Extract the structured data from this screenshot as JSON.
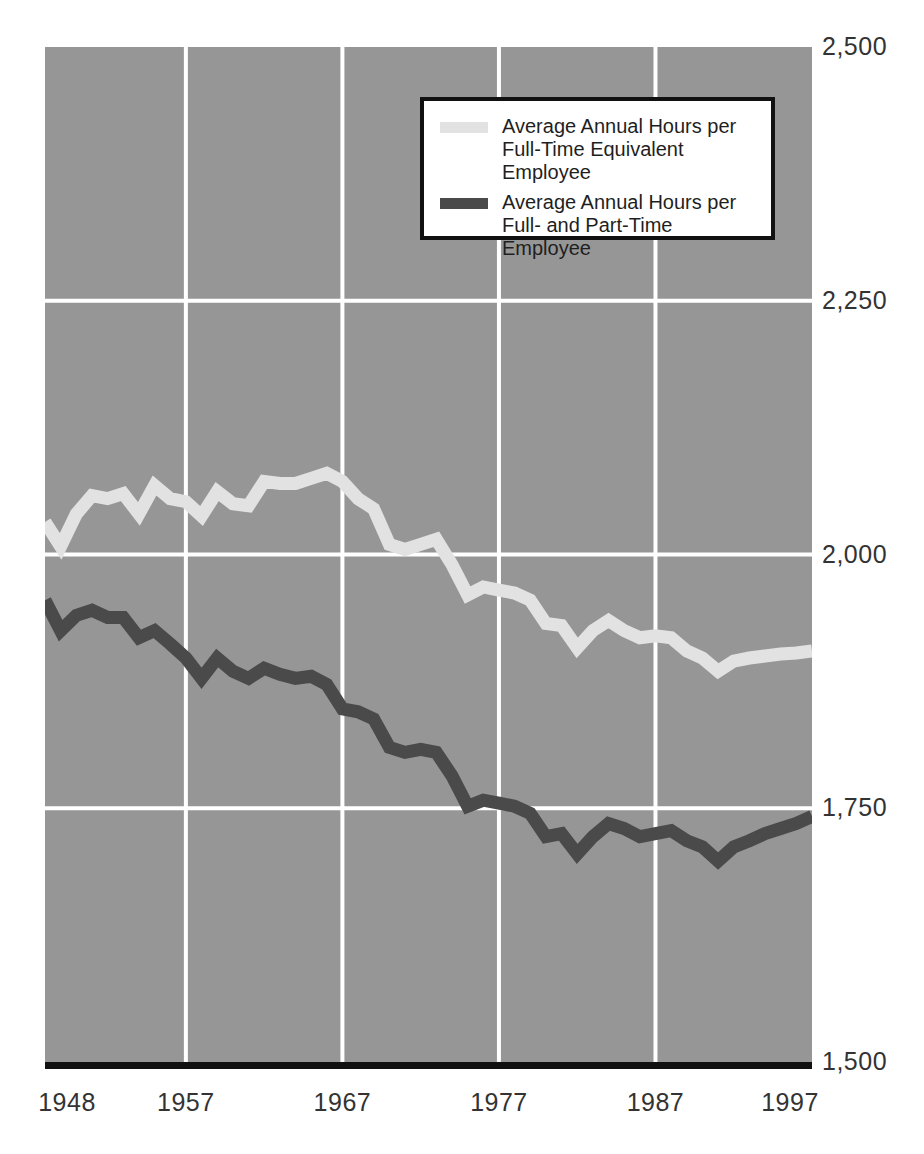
{
  "chart_data": {
    "type": "line",
    "title": "",
    "subtitle": "",
    "xlabel": "",
    "ylabel": "",
    "xlim": [
      1948,
      1997
    ],
    "ylim": [
      1500,
      2500
    ],
    "grid": true,
    "grid_color": "#ffffff",
    "plot_background": "#969696",
    "legend_position": "top-center-right",
    "y_ticks": [
      "2,500",
      "2,250",
      "2,000",
      "1,750",
      "1,500"
    ],
    "y_tick_values": [
      2500,
      2250,
      2000,
      1750,
      1500
    ],
    "x_ticks": [
      "1948",
      "1957",
      "1967",
      "1977",
      "1987",
      "1997"
    ],
    "x_tick_values": [
      1948,
      1957,
      1967,
      1977,
      1987,
      1997
    ],
    "x": [
      1948,
      1949,
      1950,
      1951,
      1952,
      1953,
      1954,
      1955,
      1956,
      1957,
      1958,
      1959,
      1960,
      1961,
      1962,
      1963,
      1964,
      1965,
      1966,
      1967,
      1968,
      1969,
      1970,
      1971,
      1972,
      1973,
      1974,
      1975,
      1976,
      1977,
      1978,
      1979,
      1980,
      1981,
      1982,
      1983,
      1984,
      1985,
      1986,
      1987,
      1988,
      1989,
      1990,
      1991,
      1992,
      1993,
      1994,
      1995,
      1996,
      1997
    ],
    "series": [
      {
        "name": "Average Annual Hours per Full-Time Equivalent Employee",
        "color": "#e2e2e2",
        "values": [
          2032,
          2008,
          2040,
          2058,
          2055,
          2060,
          2040,
          2068,
          2055,
          2052,
          2038,
          2062,
          2050,
          2048,
          2072,
          2070,
          2070,
          2075,
          2080,
          2072,
          2055,
          2045,
          2010,
          2005,
          2010,
          2015,
          1990,
          1960,
          1968,
          1965,
          1962,
          1955,
          1932,
          1930,
          1908,
          1925,
          1935,
          1925,
          1918,
          1920,
          1918,
          1905,
          1898,
          1885,
          1895,
          1898,
          1900,
          1902,
          1903,
          1905
        ]
      },
      {
        "name": "Average Annual Hours per Full- and Part-Time Employee",
        "color": "#4a4a4a",
        "values": [
          1955,
          1925,
          1940,
          1945,
          1938,
          1938,
          1918,
          1925,
          1912,
          1898,
          1878,
          1898,
          1885,
          1878,
          1888,
          1882,
          1878,
          1880,
          1872,
          1848,
          1845,
          1838,
          1810,
          1805,
          1808,
          1805,
          1782,
          1752,
          1758,
          1755,
          1752,
          1745,
          1722,
          1725,
          1705,
          1722,
          1735,
          1730,
          1722,
          1725,
          1728,
          1718,
          1712,
          1698,
          1712,
          1718,
          1725,
          1730,
          1735,
          1742
        ]
      }
    ]
  },
  "legend": {
    "entries": [
      {
        "swatch": "light",
        "label": "Average Annual Hours per\nFull-Time Equivalent Employee"
      },
      {
        "swatch": "dark",
        "label": "Average Annual Hours per\nFull- and Part-Time Employee"
      }
    ]
  }
}
